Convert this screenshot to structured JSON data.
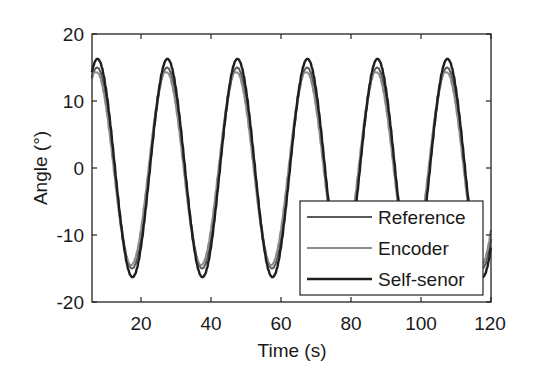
{
  "chart_data": {
    "type": "line",
    "title": "",
    "xlabel": "Time (s)",
    "ylabel": "Angle (°)",
    "xlim": [
      6,
      120
    ],
    "ylim": [
      -20,
      20
    ],
    "xticks": [
      20,
      40,
      60,
      80,
      100,
      120
    ],
    "yticks": [
      -20,
      -10,
      0,
      10,
      20
    ],
    "grid": false,
    "legend_position": "lower right",
    "x": [
      6,
      8,
      10,
      12,
      14,
      16,
      18,
      20,
      22,
      24,
      26,
      28,
      30,
      32,
      34,
      36,
      38,
      40,
      42,
      44,
      46,
      48,
      50,
      52,
      54,
      56,
      58,
      60,
      62,
      64,
      66,
      68,
      70,
      72,
      74,
      76,
      78,
      80,
      82,
      84,
      86,
      88,
      90,
      92,
      94,
      96,
      98,
      100,
      102,
      104,
      106,
      108,
      110,
      112,
      114,
      116,
      118,
      120
    ],
    "series": [
      {
        "name": "Reference",
        "color": "#5a5a5a",
        "amplitude": 15,
        "period": 20,
        "peak_times": [
          7.5,
          27,
          47,
          67,
          87,
          107
        ],
        "values": [
          14.3,
          14.7,
          8.6,
          -0.2,
          -8.5,
          -14.3,
          -14.5,
          -8.8,
          -0.5,
          8.0,
          13.9,
          14.8,
          9.5,
          0.9,
          -7.4,
          -13.6,
          -14.9,
          -10.1,
          -1.6,
          6.7,
          13.4,
          15.0,
          10.6,
          2.3,
          -5.9,
          -12.8,
          -15.0,
          -11.4,
          -3.3,
          5.3,
          12.7,
          14.9,
          11.7,
          3.9,
          -4.8,
          -12.2,
          -14.9,
          -12.1,
          -4.5,
          4.3,
          12.1,
          14.8,
          12.4,
          5.1,
          -3.9,
          -11.5,
          -14.8,
          -12.7,
          -5.6,
          3.4,
          11.5,
          14.6,
          13.0,
          6.3,
          -2.9,
          -10.9,
          -14.5,
          -7.8
        ]
      },
      {
        "name": "Encoder",
        "color": "#8c8c8c",
        "amplitude": 14.5,
        "period": 20,
        "peak_times": [
          7.2,
          26.7,
          46.7,
          66.7,
          86.7,
          106.7
        ],
        "values": [
          13.2,
          13.5,
          7.2,
          -1.4,
          -9.5,
          -14.1,
          -14.0,
          -7.5,
          0.5,
          8.8,
          13.7,
          14.2,
          8.2,
          -0.3,
          -8.4,
          -13.5,
          -14.4,
          -8.9,
          -0.6,
          7.5,
          13.2,
          14.4,
          9.3,
          1.2,
          -7.1,
          -12.9,
          -14.5,
          -10.0,
          -1.9,
          6.4,
          12.7,
          14.4,
          10.4,
          2.6,
          -6.1,
          -12.6,
          -14.5,
          -10.8,
          -3.1,
          5.6,
          12.3,
          14.3,
          11.1,
          3.7,
          -5.1,
          -12.0,
          -14.4,
          -11.4,
          -4.3,
          4.8,
          11.8,
          14.2,
          11.8,
          4.9,
          -4.2,
          -11.4,
          -14.3,
          -6.5
        ]
      },
      {
        "name": "Self-senor",
        "color": "#1e1e1e",
        "amplitude": 16.3,
        "period": 20,
        "peak_times": [
          7.6,
          27.2,
          47.2,
          67.2,
          87.2,
          107.2
        ],
        "values": [
          14.5,
          15.1,
          9.4,
          0.3,
          -8.5,
          -15.6,
          -15.9,
          -10.2,
          -1.2,
          8.0,
          14.7,
          16.2,
          10.9,
          1.9,
          -7.5,
          -14.7,
          -16.9,
          -11.8,
          -2.4,
          6.9,
          14.2,
          16.3,
          12.2,
          3.0,
          -6.3,
          -13.9,
          -16.1,
          -12.8,
          -3.9,
          5.7,
          13.4,
          16.2,
          13.1,
          4.5,
          -4.8,
          -13.3,
          -16.2,
          -13.6,
          -5.3,
          4.7,
          13.0,
          16.0,
          13.8,
          5.9,
          -4.1,
          -12.6,
          -16.1,
          -13.9,
          -6.4,
          3.7,
          12.4,
          16.1,
          14.0,
          7.1,
          -3.2,
          -11.8,
          -15.9,
          -3.0
        ]
      }
    ]
  },
  "axes": {
    "xlabel": "Time (s)",
    "ylabel": "Angle (°)",
    "xtick_labels": [
      "20",
      "40",
      "60",
      "80",
      "100",
      "120"
    ],
    "ytick_labels": [
      "-20",
      "-10",
      "0",
      "10",
      "20"
    ]
  },
  "legend": {
    "items": [
      {
        "label": "Reference",
        "color": "#5a5a5a"
      },
      {
        "label": "Encoder",
        "color": "#8c8c8c"
      },
      {
        "label": "Self-senor",
        "color": "#1e1e1e"
      }
    ]
  }
}
